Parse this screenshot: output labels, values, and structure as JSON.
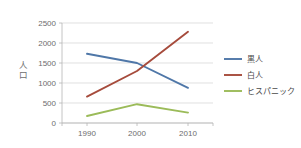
{
  "chart_data": {
    "type": "line",
    "title": "",
    "xlabel": "",
    "ylabel": "人口",
    "x": [
      1990,
      2000,
      2010
    ],
    "categories": [
      "1990",
      "2000",
      "2010"
    ],
    "xtick_labels": [
      "1990",
      "2000",
      "2010"
    ],
    "ytick_labels": [
      "0",
      "500",
      "1000",
      "1500",
      "2000",
      "2500"
    ],
    "ytick_values": [
      0,
      500,
      1000,
      1500,
      2000,
      2500
    ],
    "ylim": [
      0,
      2500
    ],
    "xlim": [
      1985,
      2015
    ],
    "grid": "horizontal",
    "legend_position": "right",
    "series": [
      {
        "name": "黒人",
        "values": [
          1730,
          1500,
          880
        ],
        "color": "#4f77a8"
      },
      {
        "name": "白人",
        "values": [
          660,
          1300,
          2280
        ],
        "color": "#a64b3c"
      },
      {
        "name": "ヒスパニック",
        "values": [
          175,
          470,
          260
        ],
        "color": "#9bbb59"
      }
    ]
  },
  "axes": {
    "y_title": "人口",
    "y_title_chars": [
      "人",
      "口"
    ]
  },
  "legend": {
    "entries": [
      {
        "label": "黒人"
      },
      {
        "label": "白人"
      },
      {
        "label": "ヒスパニック"
      }
    ]
  },
  "colors": {
    "series_black_population": "#4f77a8",
    "series_white_population": "#a64b3c",
    "series_hispanic_population": "#9bbb59",
    "gridline": "#d3d3d3",
    "axis": "#b5b5b5",
    "tick_text": "#6d6d6d",
    "legend_text": "#4a4a4a",
    "background": "#ffffff"
  }
}
